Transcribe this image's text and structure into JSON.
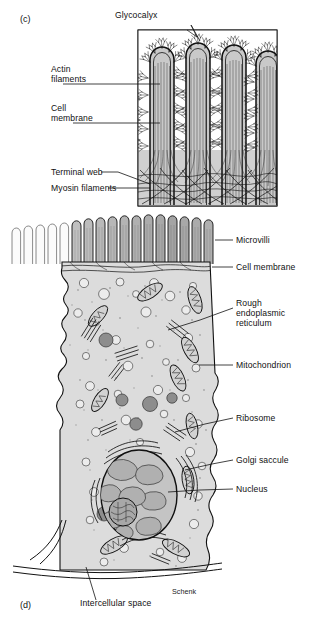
{
  "figure": {
    "panel_c": {
      "id_label": "(c)",
      "labels": {
        "glycocalyx": "Glycocalyx",
        "actin_filaments": "Actin\nfilaments",
        "cell_membrane": "Cell\nmembrane",
        "terminal_web": "Terminal web",
        "myosin_filaments": "Myosin filaments"
      },
      "structure": {
        "microvilli_count": 4,
        "border": true,
        "description": "Cross-section of four microvilli with glycocalyx coat, internal actin filament bundles, terminal web and myosin filaments at base"
      }
    },
    "panel_d": {
      "id_label": "(d)",
      "labels": {
        "microvilli": "Microvilli",
        "cell_membrane": "Cell membrane",
        "rough_er": "Rough\nendoplasmic\nreticulum",
        "mitochondrion": "Mitochondrion",
        "ribosome": "Ribosome",
        "golgi_saccule": "Golgi saccule",
        "nucleus": "Nucleus",
        "intercellular_space": "Intercellular space"
      },
      "structure": {
        "microvilli_count": 22,
        "description": "Whole absorptive epithelial cell with apical brush border, cytoplasmic organelles, nucleus with nucleolus, and basal lamina"
      }
    },
    "signature": "Schenk"
  },
  "colors": {
    "ink": "#1a1a1a",
    "cytoplasm": "#dcdcdc",
    "microvillus_fill": "#b8b8b8",
    "microvillus_light": "#f2f2f2",
    "organelle_dark": "#8f8f8f",
    "nucleus_fill": "#c6c6c6",
    "nucleoplasm": "#b0b0b0",
    "panel_c_fill": "#d6d6d6",
    "background": "#ffffff"
  }
}
